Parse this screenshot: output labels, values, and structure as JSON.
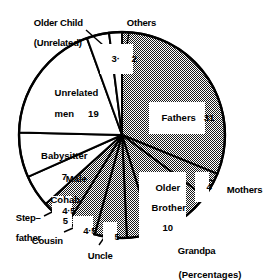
{
  "chart_data": {
    "type": "pie",
    "title": "",
    "subtitle": "",
    "caption": "(Percentages)",
    "unit": "percent",
    "total": 99.5,
    "start_angle_deg": 0,
    "direction": "clockwise",
    "legend": "none",
    "grid": false,
    "categories": [
      "Fathers",
      "Mothers",
      "Older Brother",
      "Grandpa",
      "Uncle",
      "Cousin",
      "Step-father",
      "Male Cohab",
      "Babysitter",
      "Unrelated men",
      "Older Child (Unrelated)",
      "Others"
    ],
    "values": [
      31,
      4,
      10,
      4,
      5,
      4.5,
      4.5,
      5,
      7,
      19,
      3.5,
      2
    ],
    "value_labels": [
      "31",
      "4",
      "10",
      "4",
      "5",
      "4·5",
      "4·5",
      "5",
      "7",
      "19",
      "3·5",
      "2"
    ],
    "slices": [
      {
        "name": "Fathers",
        "value": 31,
        "label": "Fathers",
        "value_label": "31",
        "shaded": true,
        "label_style": "inside-chip"
      },
      {
        "name": "Mothers",
        "value": 4,
        "label": "Mothers",
        "value_label": "4",
        "shaded": true,
        "label_style": "callout-right"
      },
      {
        "name": "Older Brother",
        "value": 10,
        "label": "Older\nBrother",
        "value_label": "10",
        "shaded": true,
        "label_style": "inside-chip"
      },
      {
        "name": "Grandpa",
        "value": 4,
        "label": "Grandpa",
        "value_label": "4",
        "shaded": true,
        "label_style": "callout-bottom"
      },
      {
        "name": "Uncle",
        "value": 5,
        "label": "Uncle",
        "value_label": "5",
        "shaded": true,
        "label_style": "callout-bottom"
      },
      {
        "name": "Cousin",
        "value": 4.5,
        "label": "Cousin",
        "value_label": "4·5",
        "shaded": true,
        "label_style": "callout-bottom-left"
      },
      {
        "name": "Step-father",
        "value": 4.5,
        "label": "Step–\nfather",
        "value_label": "4·5",
        "shaded": true,
        "label_style": "callout-left"
      },
      {
        "name": "Male Cohab",
        "value": 5,
        "label": "Male\nCohab",
        "value_label": "5",
        "shaded": false,
        "label_style": "inside-plain"
      },
      {
        "name": "Babysitter",
        "value": 7,
        "label": "Babysitter",
        "value_label": "7",
        "shaded": false,
        "label_style": "inside-plain"
      },
      {
        "name": "Unrelated men",
        "value": 19,
        "label": "Unrelated\nmen",
        "value_label": "19",
        "shaded": false,
        "label_style": "inside-plain"
      },
      {
        "name": "Older Child (Unrelated)",
        "value": 3.5,
        "label": "Older Child\n(Unrelated)",
        "value_label": "3·5",
        "shaded": false,
        "label_style": "callout-top-left"
      },
      {
        "name": "Others",
        "value": 2,
        "label": "Others",
        "value_label": "2",
        "shaded": false,
        "label_style": "callout-top"
      }
    ],
    "xlabel": "",
    "ylabel": ""
  },
  "labels": {
    "older_child_line1": "Older Child",
    "older_child_line2": "(Unrelated)",
    "others": "Others",
    "unrelated_men_line1": "Unrelated",
    "unrelated_men_line2": "men",
    "unrelated_men_value": "19",
    "babysitter_line1": "Babysitter",
    "babysitter_line2": "7",
    "male_line": "Male",
    "cohab_line1": "Cohab",
    "cohab_line2": "5",
    "step_line1": "Step–",
    "step_line2": "father",
    "cousin": "Cousin",
    "uncle": "Uncle",
    "grandpa": "Grandpa",
    "mothers": "Mothers",
    "fathers_chip": "Fathers   31",
    "older_brother_line1": "Older",
    "older_brother_line2": "Brother",
    "older_brother_line3": "10",
    "chip_older_child": "3·5",
    "chip_others": "2",
    "chip_mothers": "4",
    "chip_grandpa": "4",
    "chip_uncle": "5",
    "chip_cousin": "4·5",
    "chip_stepfather": "4·5",
    "caption": "(Percentages)"
  },
  "colors": {
    "background": "#ffffff",
    "outline": "#000000",
    "shaded_fill": "#808080",
    "unshaded_fill": "#ffffff",
    "text": "#000000"
  }
}
